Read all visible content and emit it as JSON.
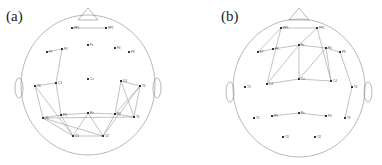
{
  "panels": [
    {
      "label": "(a)",
      "electrodes": [
        {
          "name": "FP1",
          "x": 72,
          "y": 28
        },
        {
          "name": "FP2",
          "x": 106,
          "y": 28
        },
        {
          "name": "F7",
          "x": 47,
          "y": 52
        },
        {
          "name": "F3",
          "x": 62,
          "y": 49
        },
        {
          "name": "Fz",
          "x": 88,
          "y": 45
        },
        {
          "name": "F4",
          "x": 115,
          "y": 48
        },
        {
          "name": "F8",
          "x": 129,
          "y": 52
        },
        {
          "name": "C3",
          "x": 56,
          "y": 83
        },
        {
          "name": "Cz",
          "x": 88,
          "y": 79
        },
        {
          "name": "C4",
          "x": 121,
          "y": 81
        },
        {
          "name": "T3",
          "x": 35,
          "y": 86
        },
        {
          "name": "T4",
          "x": 140,
          "y": 86
        },
        {
          "name": "T5",
          "x": 43,
          "y": 118
        },
        {
          "name": "P3",
          "x": 61,
          "y": 115
        },
        {
          "name": "Pz",
          "x": 88,
          "y": 113
        },
        {
          "name": "P4",
          "x": 115,
          "y": 114
        },
        {
          "name": "T6",
          "x": 134,
          "y": 117
        },
        {
          "name": "O1",
          "x": 73,
          "y": 136
        },
        {
          "name": "O2",
          "x": 103,
          "y": 136
        }
      ],
      "edges": [
        [
          "FP1",
          "FP2"
        ],
        [
          "F7",
          "F3"
        ],
        [
          "F3",
          "C3"
        ],
        [
          "C3",
          "T3"
        ],
        [
          "C3",
          "P3"
        ],
        [
          "T3",
          "T5"
        ],
        [
          "T3",
          "O1"
        ],
        [
          "T5",
          "P3"
        ],
        [
          "T5",
          "O2"
        ],
        [
          "T5",
          "O1"
        ],
        [
          "P3",
          "Pz"
        ],
        [
          "P3",
          "O1"
        ],
        [
          "Pz",
          "O1"
        ],
        [
          "Pz",
          "O2"
        ],
        [
          "Pz",
          "P4"
        ],
        [
          "O1",
          "O2"
        ],
        [
          "O2",
          "P4"
        ],
        [
          "O2",
          "T4"
        ],
        [
          "P4",
          "T6"
        ],
        [
          "T5",
          "T6"
        ],
        [
          "C4",
          "T4"
        ],
        [
          "C4",
          "P4"
        ],
        [
          "C4",
          "T6"
        ],
        [
          "T4",
          "P4"
        ],
        [
          "T6",
          "T4"
        ]
      ]
    },
    {
      "label": "(b)",
      "electrodes": [
        {
          "name": "FP1",
          "x": 90,
          "y": 28
        },
        {
          "name": "FP2",
          "x": 126,
          "y": 28
        },
        {
          "name": "F7",
          "x": 67,
          "y": 52
        },
        {
          "name": "F3",
          "x": 82,
          "y": 49
        },
        {
          "name": "Fz",
          "x": 108,
          "y": 45
        },
        {
          "name": "F4",
          "x": 135,
          "y": 48
        },
        {
          "name": "F8",
          "x": 149,
          "y": 52
        },
        {
          "name": "T3",
          "x": 54,
          "y": 87
        },
        {
          "name": "C3",
          "x": 76,
          "y": 84
        },
        {
          "name": "Cz",
          "x": 108,
          "y": 79
        },
        {
          "name": "C4",
          "x": 140,
          "y": 81
        },
        {
          "name": "T4",
          "x": 161,
          "y": 87
        },
        {
          "name": "T5",
          "x": 63,
          "y": 118
        },
        {
          "name": "P3",
          "x": 81,
          "y": 116
        },
        {
          "name": "Pz",
          "x": 108,
          "y": 113
        },
        {
          "name": "P4",
          "x": 135,
          "y": 116
        },
        {
          "name": "T6",
          "x": 154,
          "y": 118
        },
        {
          "name": "O1",
          "x": 92,
          "y": 137
        },
        {
          "name": "O2",
          "x": 124,
          "y": 137
        }
      ],
      "edges": [
        [
          "FP1",
          "FP2"
        ],
        [
          "FP1",
          "F7"
        ],
        [
          "FP1",
          "C3"
        ],
        [
          "FP2",
          "Fz"
        ],
        [
          "FP2",
          "C4"
        ],
        [
          "F7",
          "F3"
        ],
        [
          "F3",
          "Fz"
        ],
        [
          "Fz",
          "F4"
        ],
        [
          "F4",
          "F8"
        ],
        [
          "Fz",
          "C3"
        ],
        [
          "Fz",
          "Cz"
        ],
        [
          "F4",
          "Cz"
        ],
        [
          "F4",
          "C4"
        ],
        [
          "C3",
          "Cz"
        ],
        [
          "Cz",
          "C4"
        ],
        [
          "F8",
          "T4"
        ],
        [
          "T4",
          "T6"
        ],
        [
          "P3",
          "Pz"
        ],
        [
          "Pz",
          "P4"
        ]
      ]
    }
  ]
}
